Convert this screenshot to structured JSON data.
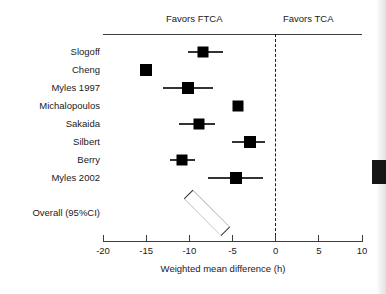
{
  "figure": {
    "title": "",
    "header": {
      "left_label": "Favors FTCA",
      "right_label": "Favors TCA"
    },
    "xlabel": "Weighted mean difference (h)",
    "overall_label": "Overall (95%CI)"
  },
  "chart_data": {
    "type": "forest",
    "title": "",
    "xlabel": "Weighted mean difference (h)",
    "ylabel": "",
    "xlim": [
      -20,
      10
    ],
    "xticks": [
      -20,
      -15,
      -10,
      -5,
      0,
      5,
      10
    ],
    "xticklabels": [
      "-20",
      "-15",
      "-10",
      "-5",
      "0",
      "5",
      "10"
    ],
    "null_value": 0,
    "grid": false,
    "legend": "none",
    "annotations": [
      "Favors FTCA",
      "Favors TCA"
    ],
    "categories": [
      "Slogoff",
      "Cheng",
      "Myles 1997",
      "Michalopoulos",
      "Sakaida",
      "Silbert",
      "Berry",
      "Myles 2002"
    ],
    "studies": [
      {
        "label": "Slogoff",
        "estimate": -8.4,
        "ci_low": -10.1,
        "ci_high": -6.1,
        "marker_size": 11
      },
      {
        "label": "Cheng",
        "estimate": -15.0,
        "ci_low": -15.0,
        "ci_high": -15.0,
        "marker_size": 12
      },
      {
        "label": "Myles 1997",
        "estimate": -10.1,
        "ci_low": -13.0,
        "ci_high": -7.3,
        "marker_size": 12
      },
      {
        "label": "Michalopoulos",
        "estimate": -4.4,
        "ci_low": -4.4,
        "ci_high": -4.4,
        "marker_size": 11
      },
      {
        "label": "Sakaida",
        "estimate": -8.9,
        "ci_low": -11.2,
        "ci_high": -7.0,
        "marker_size": 11
      },
      {
        "label": "Silbert",
        "estimate": -3.0,
        "ci_low": -5.1,
        "ci_high": -1.2,
        "marker_size": 12
      },
      {
        "label": "Berry",
        "estimate": -10.8,
        "ci_low": -12.2,
        "ci_high": -9.4,
        "marker_size": 11
      },
      {
        "label": "Myles 2002",
        "estimate": -4.6,
        "ci_low": -7.8,
        "ci_high": -1.5,
        "marker_size": 12
      }
    ],
    "overall": {
      "label": "Overall (95%CI)",
      "estimate": -7.9,
      "ci_low": -12.1,
      "ci_high": -3.7
    }
  },
  "colors": {
    "marker": "#000000",
    "line": "#333333",
    "axis": "#3d3d3d",
    "text": "#1a1a1a",
    "background": "#ffffff"
  }
}
